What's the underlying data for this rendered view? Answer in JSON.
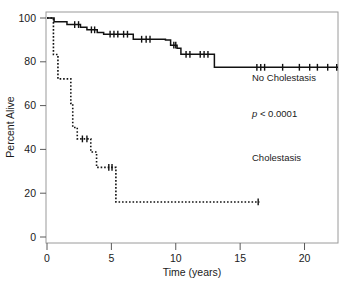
{
  "figure": {
    "background": "#ffffff",
    "frame_color": "#9a9a9a",
    "curve_color": "#111111"
  },
  "axes": {
    "x": {
      "label": "Time (years)",
      "ticks": [
        0,
        5,
        10,
        15,
        20
      ],
      "tick_labels": [
        "0",
        "5",
        "10",
        "15",
        "20"
      ],
      "min": 0,
      "max": 22.6
    },
    "y": {
      "label": "Percent Alive",
      "ticks": [
        0,
        20,
        40,
        60,
        80,
        100
      ],
      "tick_labels": [
        "0",
        "20",
        "40",
        "60",
        "80",
        "100"
      ],
      "min": 0,
      "max": 100
    }
  },
  "annotations": {
    "no_cholestasis_label": "No Cholestasis",
    "pvalue_italic": "p",
    "pvalue_rest": " < 0.0001",
    "cholestasis_label": "Cholestasis"
  },
  "chart_data": {
    "type": "line",
    "title": "",
    "xlabel": "Time (years)",
    "ylabel": "Percent Alive",
    "xlim": [
      0,
      22.6
    ],
    "ylim": [
      0,
      100
    ],
    "grid": false,
    "legend_position": "inline-annotation",
    "plot_style": "kaplan-meier step function with censoring tick marks",
    "series": [
      {
        "name": "No Cholestasis",
        "linestyle": "solid",
        "color": "#111111",
        "steps": [
          [
            0.0,
            100.0
          ],
          [
            0.55,
            100.0
          ],
          [
            0.55,
            98.3
          ],
          [
            1.55,
            98.3
          ],
          [
            1.55,
            97.0
          ],
          [
            2.6,
            97.0
          ],
          [
            2.6,
            95.8
          ],
          [
            3.1,
            95.8
          ],
          [
            3.1,
            94.6
          ],
          [
            3.9,
            94.6
          ],
          [
            3.9,
            93.4
          ],
          [
            4.4,
            93.4
          ],
          [
            4.4,
            92.6
          ],
          [
            6.7,
            92.6
          ],
          [
            6.7,
            90.3
          ],
          [
            9.2,
            90.3
          ],
          [
            9.2,
            90.0
          ],
          [
            9.6,
            90.0
          ],
          [
            9.6,
            87.6
          ],
          [
            10.1,
            87.6
          ],
          [
            10.1,
            86.2
          ],
          [
            10.4,
            86.2
          ],
          [
            10.4,
            83.4
          ],
          [
            13.0,
            83.4
          ],
          [
            13.0,
            77.5
          ],
          [
            22.6,
            77.5
          ]
        ],
        "censor_marks": [
          [
            2.15,
            97.0
          ],
          [
            2.45,
            97.0
          ],
          [
            3.45,
            94.6
          ],
          [
            3.7,
            94.6
          ],
          [
            4.9,
            92.6
          ],
          [
            5.2,
            92.6
          ],
          [
            5.5,
            92.6
          ],
          [
            5.95,
            92.6
          ],
          [
            6.25,
            92.6
          ],
          [
            7.35,
            90.3
          ],
          [
            7.7,
            90.3
          ],
          [
            8.0,
            90.3
          ],
          [
            9.85,
            87.6
          ],
          [
            10.0,
            87.6
          ],
          [
            10.8,
            83.4
          ],
          [
            11.1,
            83.4
          ],
          [
            11.9,
            83.4
          ],
          [
            12.2,
            83.4
          ],
          [
            12.5,
            83.4
          ],
          [
            16.3,
            77.5
          ],
          [
            16.6,
            77.5
          ],
          [
            16.9,
            77.5
          ],
          [
            18.3,
            77.5
          ],
          [
            19.6,
            77.5
          ],
          [
            20.4,
            77.5
          ],
          [
            21.0,
            77.5
          ],
          [
            21.8,
            77.5
          ],
          [
            22.5,
            77.5
          ]
        ]
      },
      {
        "name": "Cholestasis",
        "linestyle": "dotted",
        "color": "#111111",
        "steps": [
          [
            0.0,
            100.0
          ],
          [
            0.5,
            100.0
          ],
          [
            0.5,
            83.3
          ],
          [
            0.85,
            83.3
          ],
          [
            0.85,
            72.2
          ],
          [
            1.85,
            72.2
          ],
          [
            1.85,
            61.0
          ],
          [
            2.0,
            61.0
          ],
          [
            2.0,
            50.0
          ],
          [
            2.35,
            50.0
          ],
          [
            2.35,
            44.8
          ],
          [
            3.4,
            44.8
          ],
          [
            3.4,
            38.8
          ],
          [
            3.85,
            38.8
          ],
          [
            3.85,
            31.8
          ],
          [
            5.35,
            31.8
          ],
          [
            5.35,
            16.0
          ],
          [
            16.5,
            16.0
          ]
        ],
        "censor_marks": [
          [
            2.75,
            44.8
          ],
          [
            3.1,
            44.8
          ],
          [
            4.8,
            31.8
          ],
          [
            5.05,
            31.8
          ],
          [
            16.4,
            16.0
          ]
        ]
      }
    ]
  }
}
